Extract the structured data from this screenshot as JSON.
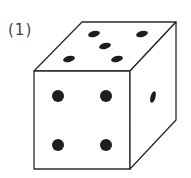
{
  "problem": {
    "label": "(1)",
    "figure": "die-cube",
    "faces": {
      "top": {
        "pips": 5
      },
      "front": {
        "pips": 4
      },
      "right": {
        "pips": 1
      }
    }
  },
  "colors": {
    "line": "#2a2a2a",
    "pip": "#1e1e1e",
    "background": "#ffffff"
  }
}
